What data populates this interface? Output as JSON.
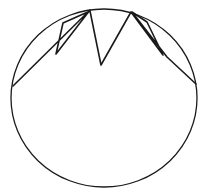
{
  "figure": {
    "background_color": "#ffffff",
    "stroke_color": "#1a1a1a",
    "width": 208,
    "height": 196
  },
  "shapes": {
    "ellipse": {
      "name": "circle-outline",
      "center_x": 104,
      "center_y": 98,
      "radius_x": 93,
      "radius_y": 89,
      "stroke_width": 1.3
    },
    "zigzag": {
      "name": "zigzag-polyline",
      "stroke_width": 1.6,
      "points": [
        {
          "x": 13,
          "y": 86
        },
        {
          "x": 90,
          "y": 10
        },
        {
          "x": 56,
          "y": 54
        },
        {
          "x": 63,
          "y": 23
        },
        {
          "x": 90,
          "y": 11
        },
        {
          "x": 101,
          "y": 65
        },
        {
          "x": 131,
          "y": 12
        },
        {
          "x": 163,
          "y": 55
        },
        {
          "x": 147,
          "y": 22
        },
        {
          "x": 132,
          "y": 12
        },
        {
          "x": 167,
          "y": 57
        },
        {
          "x": 196,
          "y": 84
        }
      ],
      "path_d": "M 13 86 L 90 10 L 56 54 L 63 23 L 90 11 L 101 65 L 131 12 L 163 55 L 147 22 L 132 12 L 167 57 L 196 84"
    },
    "vertices": [
      {
        "name": "left-apex",
        "x": 90,
        "y": 10
      },
      {
        "name": "left-spike-tip",
        "x": 56,
        "y": 54
      },
      {
        "name": "center-valley",
        "x": 101,
        "y": 65
      },
      {
        "name": "right-apex",
        "x": 131,
        "y": 12
      },
      {
        "name": "right-spike-tip",
        "x": 163,
        "y": 55
      }
    ]
  }
}
